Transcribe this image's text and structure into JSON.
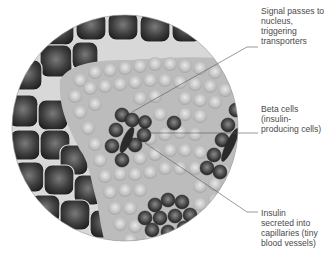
{
  "diagram": {
    "colors": {
      "background": "#ffffff",
      "exocrine_cell": "#3a3a3a",
      "exocrine_border": "#d8d8d8",
      "islet_matrix": "#bdbdbd",
      "islet_cell": "#c9c9c9",
      "beta_cell": "#3c3c3c",
      "leader_line": "#555555",
      "label_text": "#4a4a4a"
    },
    "labels": [
      {
        "id": "signal",
        "text": "Signal passes to\nnucleus, triggering\ntransporters"
      },
      {
        "id": "beta",
        "text": "Beta cells\n(insulin-\nproducing cells)"
      },
      {
        "id": "insulin",
        "text": "Insulin\nsecreted into\ncapillaries (tiny\nblood vessels)"
      }
    ]
  }
}
